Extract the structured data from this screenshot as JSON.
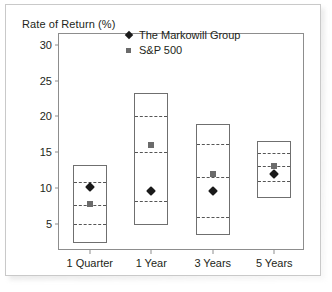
{
  "chart_data": {
    "type": "bar",
    "title": "",
    "ylabel": "Rate of Return (%)",
    "xlabel": "",
    "ylim": [
      1.2,
      31.5
    ],
    "yticks": [
      5,
      10,
      15,
      20,
      25,
      30
    ],
    "grid": false,
    "legend_position": "top-right",
    "categories": [
      "1 Quarter",
      "1 Year",
      "3 Years",
      "5 Years"
    ],
    "boxes": [
      {
        "category": "1 Quarter",
        "top": 13.2,
        "bottom": 2.3,
        "dividers": [
          10.8,
          7.6,
          5.0
        ]
      },
      {
        "category": "1 Year",
        "top": 23.3,
        "bottom": 4.8,
        "dividers": [
          20.0,
          15.0,
          8.2
        ]
      },
      {
        "category": "3 Years",
        "top": 19.0,
        "bottom": 3.5,
        "dividers": [
          16.1,
          11.6,
          5.9
        ]
      },
      {
        "category": "5 Years",
        "top": 16.5,
        "bottom": 8.6,
        "dividers": [
          14.9,
          13.0,
          11.0
        ]
      }
    ],
    "series": [
      {
        "name": "The Markowill Group",
        "marker": "diamond",
        "color": "#1a1a1a",
        "values": [
          10.1,
          9.6,
          9.6,
          12.0
        ]
      },
      {
        "name": "S&P 500",
        "marker": "square",
        "color": "#6b6b6b",
        "values": [
          7.7,
          16.0,
          11.9,
          13.0
        ]
      }
    ]
  },
  "legend": {
    "entries": [
      {
        "label": "The Markowill Group",
        "marker": "diamond"
      },
      {
        "label": "S&P 500",
        "marker": "square"
      }
    ]
  },
  "colors": {
    "frame": "#8d8d8d",
    "box_outline": "#6f6f6f",
    "divider": "#555555",
    "markowill": "#1a1a1a",
    "sp500": "#6b6b6b",
    "text": "#231f20",
    "card_border": "#c9c9c9"
  }
}
